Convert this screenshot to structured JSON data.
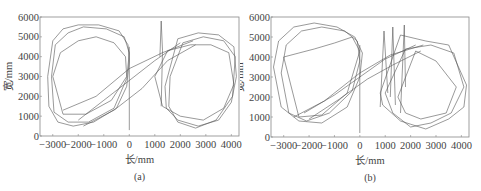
{
  "chart_data": [
    {
      "id": "a",
      "type": "line",
      "caption": "(a)",
      "xlabel": "长/mm",
      "ylabel": "宽/mm",
      "xlim": [
        -3500,
        4300
      ],
      "ylim": [
        0,
        6000
      ],
      "xticks": [
        -3000,
        -2000,
        -1000,
        0,
        1000,
        2000,
        3000,
        4000
      ],
      "xtick_labels": [
        "-3000",
        "-2000",
        "-1000",
        "0",
        "1000",
        "2000",
        "3000",
        "4000"
      ],
      "yticks": [
        0,
        1000,
        2000,
        3000,
        4000,
        5000,
        6000
      ],
      "ytick_labels": [
        "0",
        "1000",
        "2000",
        "3000",
        "4000",
        "5000",
        "6000"
      ],
      "grid": false,
      "legend": null,
      "description": "Figure-eight trajectory: multiple overlapping closed loops around a left lobe centered near (-2000, 3000) and a right lobe centered near (2700, 2800), connected by diagonal crossing segments through x≈0; vertical spike near x≈1250 reaching ~5800.",
      "series": [
        {
          "name": "left-loop-1",
          "x": [
            -3200,
            -3000,
            -2600,
            -2000,
            -1200,
            -400,
            -50,
            0,
            -100,
            -500,
            -1400,
            -2200,
            -2800,
            -3150,
            -3200
          ],
          "y": [
            3000,
            4800,
            5400,
            5600,
            5600,
            5300,
            4600,
            3800,
            2500,
            1400,
            700,
            500,
            700,
            1500,
            3000
          ]
        },
        {
          "name": "left-loop-2",
          "x": [
            -3050,
            -2900,
            -2400,
            -1800,
            -900,
            -200,
            0,
            -100,
            -600,
            -1600,
            -2400,
            -2950,
            -3050
          ],
          "y": [
            3000,
            4600,
            5200,
            5500,
            5400,
            5000,
            4200,
            2900,
            1400,
            700,
            700,
            1200,
            3000
          ]
        },
        {
          "name": "left-loop-3",
          "x": [
            -3000,
            -2700,
            -2000,
            -1300,
            -600,
            -150,
            -100,
            -700,
            -1700,
            -2600,
            -3000
          ],
          "y": [
            3000,
            4200,
            4800,
            5000,
            4700,
            4000,
            3000,
            1800,
            1100,
            1100,
            3000
          ]
        },
        {
          "name": "right-loop-1",
          "x": [
            1400,
            1900,
            2700,
            3500,
            4100,
            4200,
            4000,
            3500,
            2700,
            1900,
            1450,
            1400
          ],
          "y": [
            2500,
            4900,
            5200,
            5100,
            4500,
            3000,
            1700,
            800,
            500,
            800,
            1400,
            2500
          ]
        },
        {
          "name": "right-loop-2",
          "x": [
            1600,
            2100,
            2900,
            3700,
            4150,
            4050,
            3400,
            2600,
            1900,
            1550,
            1600
          ],
          "y": [
            3000,
            4700,
            5000,
            4800,
            4000,
            2000,
            800,
            400,
            700,
            1500,
            3000
          ]
        },
        {
          "name": "right-loop-3",
          "x": [
            1000,
            1500,
            2400,
            3200,
            3900,
            4100,
            3700,
            2900,
            2000,
            1300,
            1000
          ],
          "y": [
            3000,
            4300,
            4600,
            4600,
            4200,
            2600,
            1400,
            800,
            1000,
            1500,
            3000
          ]
        },
        {
          "name": "cross-1",
          "x": [
            -2000,
            -1000,
            0,
            1000,
            2000
          ],
          "y": [
            800,
            1800,
            2800,
            3800,
            4700
          ]
        },
        {
          "name": "cross-2",
          "x": [
            -2600,
            -1300,
            0,
            1300,
            2500
          ],
          "y": [
            1300,
            2000,
            3400,
            4200,
            4800
          ]
        },
        {
          "name": "cross-3",
          "x": [
            -1800,
            -600,
            500,
            1500,
            2600
          ],
          "y": [
            500,
            1300,
            2400,
            3800,
            4600
          ]
        },
        {
          "name": "vertical-0",
          "x": [
            0,
            0
          ],
          "y": [
            300,
            4500
          ]
        },
        {
          "name": "spike",
          "x": [
            1200,
            1250,
            1300,
            1250
          ],
          "y": [
            4000,
            5800,
            4300,
            1500
          ]
        }
      ]
    },
    {
      "id": "b",
      "type": "line",
      "caption": "(b)",
      "xlabel": "长/mm",
      "ylabel": "宽/mm",
      "xlim": [
        -3500,
        4300
      ],
      "ylim": [
        0,
        6000
      ],
      "xticks": [
        -3000,
        -2000,
        -1000,
        0,
        1000,
        2000,
        3000,
        4000
      ],
      "xtick_labels": [
        "-3000",
        "-2000",
        "-1000",
        "0",
        "1000",
        "2000",
        "3000",
        "4000"
      ],
      "yticks": [
        0,
        1000,
        2000,
        3000,
        4000,
        5000,
        6000
      ],
      "ytick_labels": [
        "0",
        "1000",
        "2000",
        "3000",
        "4000",
        "5000",
        "6000"
      ],
      "grid": false,
      "legend": null,
      "description": "Figure-eight trajectory with an irregular rounded left lobe near (-1800, 3200) and a rotated square-like right lobe near (2600, 2600), crossing through x≈0 at y≈3000; near-vertical line pairs around x≈800–1800 reaching ~5500.",
      "series": [
        {
          "name": "left-loop-1",
          "x": [
            -3400,
            -3200,
            -2600,
            -1800,
            -900,
            -200,
            100,
            0,
            -500,
            -1500,
            -2400,
            -3100,
            -3400
          ],
          "y": [
            3500,
            4800,
            5500,
            5700,
            5500,
            5000,
            4200,
            3000,
            1500,
            700,
            800,
            1500,
            3500
          ]
        },
        {
          "name": "left-loop-2",
          "x": [
            -3100,
            -2900,
            -2300,
            -1500,
            -600,
            -100,
            0,
            -300,
            -1200,
            -2100,
            -2800,
            -3100
          ],
          "y": [
            3200,
            4600,
            5300,
            5500,
            5300,
            4800,
            3800,
            2300,
            1200,
            800,
            1200,
            3200
          ]
        },
        {
          "name": "left-loop-3",
          "x": [
            -3000,
            -2400,
            -1800,
            -1000,
            -300,
            0,
            -500,
            -1500,
            -2400,
            -3000
          ],
          "y": [
            4000,
            4200,
            4400,
            4700,
            5000,
            4300,
            2200,
            1100,
            1000,
            4000
          ]
        },
        {
          "name": "right-loop-1",
          "x": [
            800,
            1600,
            2600,
            3500,
            4200,
            4100,
            3500,
            2600,
            1600,
            900,
            800
          ],
          "y": [
            2200,
            5100,
            4800,
            4600,
            2600,
            1500,
            900,
            400,
            800,
            1600,
            2200
          ]
        },
        {
          "name": "right-loop-2",
          "x": [
            1000,
            1800,
            2800,
            3700,
            4100,
            3600,
            2800,
            2000,
            1300,
            1000
          ],
          "y": [
            2200,
            4400,
            4600,
            4200,
            2500,
            1200,
            700,
            500,
            1200,
            2200
          ]
        },
        {
          "name": "right-loop-3",
          "x": [
            1500,
            2200,
            3000,
            3800,
            3400,
            2400,
            1800,
            1500
          ],
          "y": [
            2000,
            4300,
            3800,
            2500,
            1200,
            900,
            1200,
            2000
          ]
        },
        {
          "name": "cross-1",
          "x": [
            -2200,
            -1000,
            0,
            1000,
            2200
          ],
          "y": [
            1200,
            2100,
            3000,
            3900,
            4600
          ]
        },
        {
          "name": "cross-2",
          "x": [
            -2600,
            -1400,
            0,
            1200,
            2500
          ],
          "y": [
            1000,
            1800,
            3200,
            4100,
            4600
          ]
        },
        {
          "name": "cross-3",
          "x": [
            -2000,
            -800,
            300,
            1300,
            2400
          ],
          "y": [
            900,
            1900,
            2900,
            3600,
            4300
          ]
        },
        {
          "name": "vertical-0",
          "x": [
            0,
            0
          ],
          "y": [
            200,
            4600
          ]
        },
        {
          "name": "spike-1",
          "x": [
            800,
            950,
            1100
          ],
          "y": [
            1500,
            5300,
            2200
          ]
        },
        {
          "name": "spike-2",
          "x": [
            1200,
            1300,
            1400
          ],
          "y": [
            2000,
            5500,
            1600
          ]
        },
        {
          "name": "spike-3",
          "x": [
            1600,
            1750,
            1800
          ],
          "y": [
            1200,
            5600,
            2500
          ]
        }
      ]
    }
  ]
}
